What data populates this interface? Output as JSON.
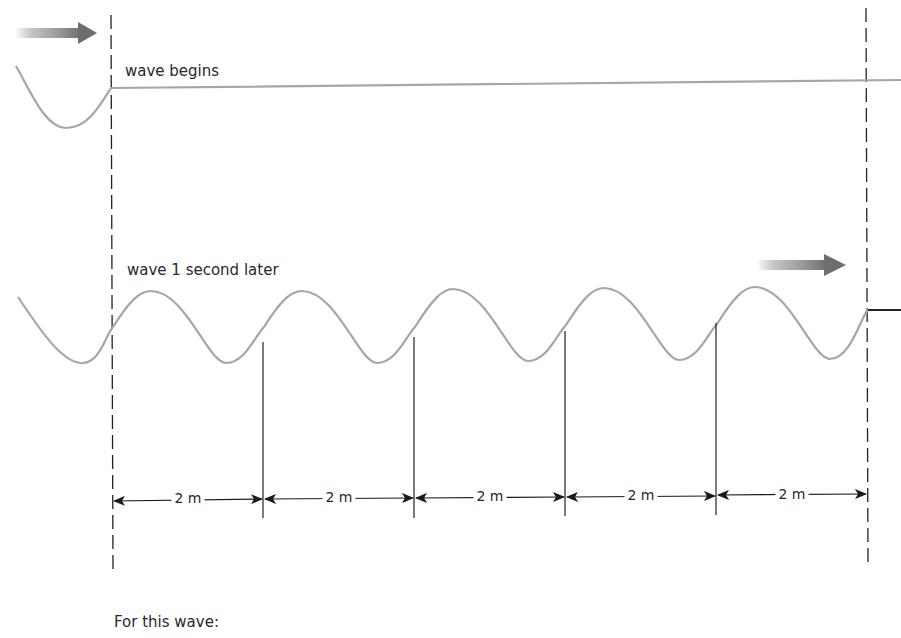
{
  "labels": {
    "wave_begins": "wave begins",
    "wave_later": "wave 1 second later",
    "footer": "For this wave:"
  },
  "dimensions": [
    {
      "label": "2 m",
      "x1": 113,
      "x2": 264
    },
    {
      "label": "2 m",
      "x1": 264,
      "x2": 415
    },
    {
      "label": "2 m",
      "x1": 415,
      "x2": 566
    },
    {
      "label": "2 m",
      "x1": 566,
      "x2": 717
    },
    {
      "label": "2 m",
      "x1": 717,
      "x2": 868
    }
  ],
  "colors": {
    "wave": "#a6a6a6",
    "line": "#222222",
    "arrow_gradient_end": "#6e6e6e"
  },
  "icons": {
    "direction_arrow_top": "right-arrow-icon",
    "direction_arrow_bottom": "right-arrow-icon"
  }
}
